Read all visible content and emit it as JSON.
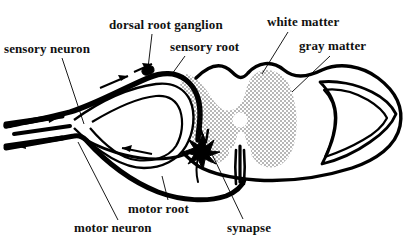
{
  "figure": {
    "width": 415,
    "height": 246,
    "background_color": "#ffffff",
    "ink_color": "#000000",
    "gray_matter_fill": "#cccccc",
    "white_matter_fill": "#ffffff"
  },
  "labels": {
    "sensory_neuron": "sensory neuron",
    "dorsal_root_ganglion": "dorsal root ganglion",
    "sensory_root": "sensory root",
    "white_matter": "white matter",
    "gray_matter": "gray matter",
    "motor_root": "motor root",
    "motor_neuron": "motor neuron",
    "synapse": "synapse"
  },
  "structures": [
    {
      "name": "spinal-cord-outline",
      "description": "oval cross-section boundary of the spinal cord"
    },
    {
      "name": "gray-matter-region",
      "description": "stippled butterfly / H-shaped central gray matter"
    },
    {
      "name": "white-matter-region",
      "description": "unshaded peripheral white matter"
    },
    {
      "name": "central-canal",
      "description": "small circular opening at the center of the gray matter"
    },
    {
      "name": "ventral-median-fissure",
      "description": "narrow vertical slit on the ventral midline"
    },
    {
      "name": "dorsal-root-ganglion-body",
      "description": "small dark swelling on the sensory root"
    },
    {
      "name": "synapse-body",
      "description": "dark starburst where sensory fiber meets motor neuron"
    },
    {
      "name": "sensory-root-fiber",
      "description": "thick afferent fiber entering the dorsal horn"
    },
    {
      "name": "motor-root-fiber",
      "description": "thick efferent fiber leaving the ventral horn"
    },
    {
      "name": "right-nerve-root-outline",
      "description": "mirrored wing-shaped nerve root outline on the right"
    }
  ],
  "flow_arrows": [
    {
      "name": "afferent-arrow-upper",
      "direction": "toward-cord",
      "on": "sensory root"
    },
    {
      "name": "afferent-arrow-entry",
      "direction": "toward-cord",
      "on": "sensory root at dorsal horn"
    },
    {
      "name": "efferent-arrow-lower",
      "direction": "away-from-cord",
      "on": "motor root"
    },
    {
      "name": "peripheral-arrow-in",
      "direction": "toward-cord",
      "on": "peripheral nerve"
    },
    {
      "name": "peripheral-arrow-out",
      "direction": "away-from-cord",
      "on": "peripheral nerve"
    }
  ]
}
